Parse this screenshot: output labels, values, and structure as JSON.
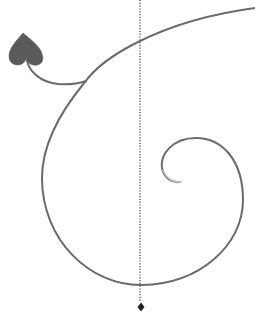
{
  "canvas": {
    "width": 255,
    "height": 312,
    "background": "#ffffff"
  },
  "colors": {
    "stroke": "#6b6b6b",
    "stroke_inner_faded": "#b0b0b0",
    "leaf_fill": "#5a5a5a",
    "guide_line": "#3a3a3a",
    "marker": "#222222"
  },
  "elements": {
    "spiral": {
      "label": "spiral-tendril"
    },
    "leaf": {
      "label": "heart-leaf",
      "shape": "heart"
    },
    "stem": {
      "label": "leaf-stem"
    },
    "guide": {
      "label": "dotted-vertical-guide",
      "x": 140,
      "y_start": 0,
      "y_end": 301
    },
    "marker": {
      "label": "diamond-marker",
      "cx": 141,
      "cy": 307
    }
  }
}
